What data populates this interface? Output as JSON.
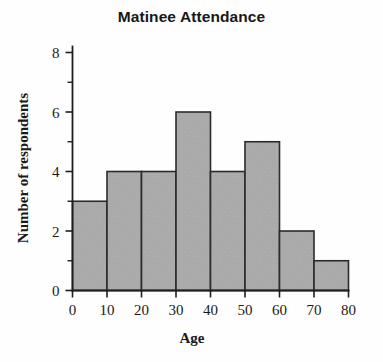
{
  "chart_data": {
    "type": "bar",
    "title": "Matinee Attendance",
    "xlabel": "Age",
    "ylabel": "Number of respondents",
    "categories": [
      "0-10",
      "10-20",
      "20-30",
      "30-40",
      "40-50",
      "50-60",
      "60-70",
      "70-80"
    ],
    "bin_edges": [
      0,
      10,
      20,
      30,
      40,
      50,
      60,
      70,
      80
    ],
    "values": [
      3,
      4,
      4,
      6,
      4,
      5,
      2,
      1
    ],
    "xlim": [
      0,
      80
    ],
    "ylim": [
      0,
      8
    ],
    "x_ticks": [
      0,
      10,
      20,
      30,
      40,
      50,
      60,
      70,
      80
    ],
    "x_tick_labels": [
      "0",
      "10",
      "20",
      "30",
      "40",
      "50",
      "60",
      "70",
      "80"
    ],
    "y_ticks": [
      0,
      2,
      4,
      6,
      8
    ],
    "y_tick_labels": [
      "0",
      "2",
      "4",
      "6",
      "8"
    ],
    "y_minor_ticks": [
      1,
      3,
      5,
      7
    ],
    "grid": false,
    "legend": false,
    "bar_fill_color": "#a9a9a9",
    "bar_edge_color": "#2b2b2b",
    "axis_color": "#1f1f1f",
    "background_color": "#ffffff"
  }
}
